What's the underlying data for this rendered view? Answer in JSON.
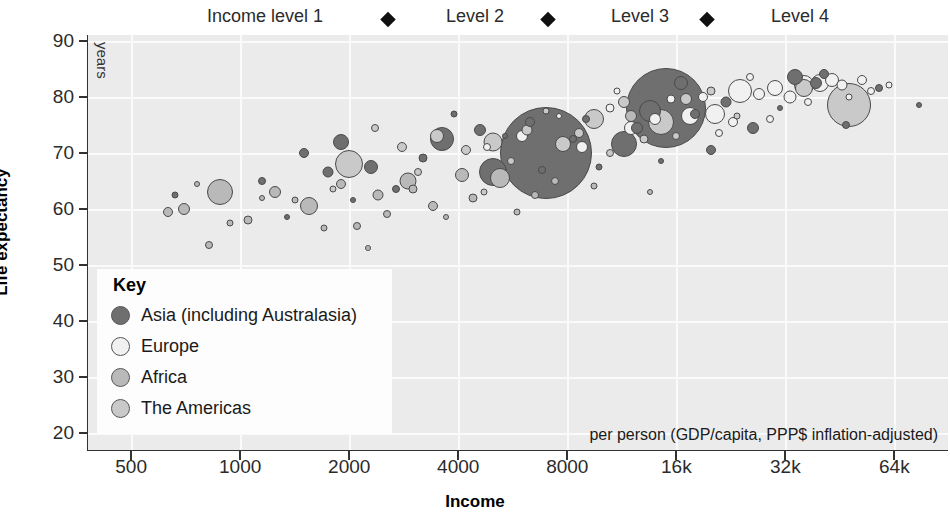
{
  "chart_data": {
    "type": "scatter",
    "title": "",
    "xlabel": "Income",
    "ylabel": "Life expectancy",
    "x_units_note": "per person (GDP/capita, PPP$ inflation-adjusted)",
    "y_units_note": "years",
    "x_scale": "log2",
    "xlim": [
      380,
      90000
    ],
    "ylim": [
      17,
      91
    ],
    "grid": true,
    "legend_position": "inside-bottom-left",
    "xticks": [
      {
        "value": 500,
        "label": "500"
      },
      {
        "value": 1000,
        "label": "1000"
      },
      {
        "value": 2000,
        "label": "2000"
      },
      {
        "value": 4000,
        "label": "4000"
      },
      {
        "value": 8000,
        "label": "8000"
      },
      {
        "value": 16000,
        "label": "16k"
      },
      {
        "value": 32000,
        "label": "32k"
      },
      {
        "value": 64000,
        "label": "64k"
      }
    ],
    "yticks": [
      {
        "value": 20,
        "label": "20"
      },
      {
        "value": 30,
        "label": "30"
      },
      {
        "value": 40,
        "label": "40"
      },
      {
        "value": 50,
        "label": "50"
      },
      {
        "value": 60,
        "label": "60"
      },
      {
        "value": 70,
        "label": "70"
      },
      {
        "value": 80,
        "label": "80"
      },
      {
        "value": 90,
        "label": "90"
      }
    ],
    "income_levels": [
      {
        "label": "Income level 1",
        "center_x": 265
      },
      {
        "label": "Level 2",
        "center_x": 475
      },
      {
        "label": "Level 3",
        "center_x": 640
      },
      {
        "label": "Level 4",
        "center_x": 800
      }
    ],
    "income_level_dividers": [
      388,
      548,
      707
    ],
    "legend": {
      "title": "Key",
      "entries": [
        {
          "name": "Asia (including Australasia)",
          "color": "#6f6f6f"
        },
        {
          "name": "Europe",
          "color": "#f1f1f1"
        },
        {
          "name": "Africa",
          "color": "#b9b9b9"
        },
        {
          "name": "The Americas",
          "color": "#c9c9c9"
        }
      ]
    },
    "series": [
      {
        "name": "Asia (including Australasia)",
        "color": "#6f6f6f",
        "points": [
          {
            "x": 7000,
            "y": 70.0,
            "r": 46.0
          },
          {
            "x": 15000,
            "y": 78.0,
            "r": 40.0
          },
          {
            "x": 5000,
            "y": 66.5,
            "r": 14.0
          },
          {
            "x": 3600,
            "y": 72.5,
            "r": 12.0
          },
          {
            "x": 11500,
            "y": 71.5,
            "r": 13.0
          },
          {
            "x": 13500,
            "y": 77.5,
            "r": 11.0
          },
          {
            "x": 1900,
            "y": 72.0,
            "r": 8.0
          },
          {
            "x": 2300,
            "y": 67.5,
            "r": 7.0
          },
          {
            "x": 4600,
            "y": 74.0,
            "r": 6.0
          },
          {
            "x": 16500,
            "y": 82.5,
            "r": 7.0
          },
          {
            "x": 34000,
            "y": 83.5,
            "r": 8.0
          },
          {
            "x": 39000,
            "y": 82.5,
            "r": 6.0
          },
          {
            "x": 41000,
            "y": 84.0,
            "r": 5.0
          },
          {
            "x": 1500,
            "y": 70.0,
            "r": 5.0
          },
          {
            "x": 1750,
            "y": 66.5,
            "r": 5.5
          },
          {
            "x": 3200,
            "y": 69.0,
            "r": 4.5
          },
          {
            "x": 6300,
            "y": 75.5,
            "r": 5.0
          },
          {
            "x": 9000,
            "y": 76.0,
            "r": 4.0
          },
          {
            "x": 12500,
            "y": 74.5,
            "r": 6.0
          },
          {
            "x": 18000,
            "y": 77.0,
            "r": 5.0
          },
          {
            "x": 22000,
            "y": 79.0,
            "r": 5.5
          },
          {
            "x": 26000,
            "y": 74.5,
            "r": 6.0
          },
          {
            "x": 2700,
            "y": 63.5,
            "r": 4.0
          },
          {
            "x": 6800,
            "y": 67.0,
            "r": 4.0
          },
          {
            "x": 1150,
            "y": 65.0,
            "r": 4.0
          },
          {
            "x": 8300,
            "y": 72.5,
            "r": 4.0
          },
          {
            "x": 20000,
            "y": 70.5,
            "r": 5.0
          },
          {
            "x": 47000,
            "y": 75.0,
            "r": 4.0
          },
          {
            "x": 58000,
            "y": 81.5,
            "r": 4.0
          },
          {
            "x": 75000,
            "y": 78.5,
            "r": 3.0
          },
          {
            "x": 3900,
            "y": 77.0,
            "r": 3.5
          },
          {
            "x": 9800,
            "y": 67.5,
            "r": 3.5
          },
          {
            "x": 2050,
            "y": 61.5,
            "r": 3.0
          },
          {
            "x": 660,
            "y": 62.5,
            "r": 3.5
          },
          {
            "x": 1350,
            "y": 58.5,
            "r": 3.0
          },
          {
            "x": 14500,
            "y": 68.5,
            "r": 3.0
          },
          {
            "x": 31000,
            "y": 78.0,
            "r": 3.0
          },
          {
            "x": 5400,
            "y": 73.0,
            "r": 3.0
          }
        ]
      },
      {
        "name": "Europe",
        "color": "#f1f1f1",
        "points": [
          {
            "x": 24000,
            "y": 81.0,
            "r": 12.0
          },
          {
            "x": 20500,
            "y": 77.0,
            "r": 10.0
          },
          {
            "x": 17500,
            "y": 76.5,
            "r": 9.0
          },
          {
            "x": 36000,
            "y": 82.0,
            "r": 10.0
          },
          {
            "x": 40000,
            "y": 82.5,
            "r": 9.0
          },
          {
            "x": 30000,
            "y": 81.5,
            "r": 8.0
          },
          {
            "x": 43000,
            "y": 83.0,
            "r": 7.0
          },
          {
            "x": 33000,
            "y": 80.0,
            "r": 6.5
          },
          {
            "x": 12000,
            "y": 74.5,
            "r": 7.0
          },
          {
            "x": 8800,
            "y": 71.0,
            "r": 6.0
          },
          {
            "x": 6000,
            "y": 73.0,
            "r": 6.0
          },
          {
            "x": 14000,
            "y": 76.0,
            "r": 6.0
          },
          {
            "x": 27000,
            "y": 80.5,
            "r": 6.0
          },
          {
            "x": 46000,
            "y": 82.0,
            "r": 5.5
          },
          {
            "x": 52000,
            "y": 83.0,
            "r": 5.0
          },
          {
            "x": 19000,
            "y": 80.0,
            "r": 5.0
          },
          {
            "x": 23000,
            "y": 75.5,
            "r": 5.0
          },
          {
            "x": 10500,
            "y": 78.0,
            "r": 4.5
          },
          {
            "x": 15500,
            "y": 79.5,
            "r": 4.5
          },
          {
            "x": 37000,
            "y": 79.0,
            "r": 4.0
          },
          {
            "x": 55000,
            "y": 81.0,
            "r": 4.0
          },
          {
            "x": 29000,
            "y": 76.0,
            "r": 4.0
          },
          {
            "x": 21000,
            "y": 73.5,
            "r": 4.0
          },
          {
            "x": 62000,
            "y": 82.0,
            "r": 3.5
          },
          {
            "x": 4800,
            "y": 71.0,
            "r": 4.0
          },
          {
            "x": 25500,
            "y": 83.5,
            "r": 4.0
          },
          {
            "x": 11000,
            "y": 81.0,
            "r": 3.5
          },
          {
            "x": 48000,
            "y": 80.0,
            "r": 3.5
          },
          {
            "x": 7600,
            "y": 76.5,
            "r": 3.0
          }
        ]
      },
      {
        "name": "Africa",
        "color": "#b9b9b9",
        "points": [
          {
            "x": 880,
            "y": 63.0,
            "r": 13.0
          },
          {
            "x": 1550,
            "y": 60.5,
            "r": 9.0
          },
          {
            "x": 2900,
            "y": 65.0,
            "r": 8.5
          },
          {
            "x": 5200,
            "y": 65.5,
            "r": 10.0
          },
          {
            "x": 4100,
            "y": 66.0,
            "r": 7.0
          },
          {
            "x": 1250,
            "y": 63.0,
            "r": 6.0
          },
          {
            "x": 700,
            "y": 60.0,
            "r": 6.0
          },
          {
            "x": 12000,
            "y": 76.5,
            "r": 6.0
          },
          {
            "x": 2400,
            "y": 62.5,
            "r": 5.5
          },
          {
            "x": 3400,
            "y": 60.5,
            "r": 5.0
          },
          {
            "x": 1900,
            "y": 64.5,
            "r": 5.0
          },
          {
            "x": 630,
            "y": 59.5,
            "r": 5.0
          },
          {
            "x": 820,
            "y": 53.5,
            "r": 4.0
          },
          {
            "x": 1050,
            "y": 58.0,
            "r": 4.5
          },
          {
            "x": 2100,
            "y": 57.0,
            "r": 4.0
          },
          {
            "x": 3000,
            "y": 63.5,
            "r": 4.5
          },
          {
            "x": 4400,
            "y": 62.0,
            "r": 4.5
          },
          {
            "x": 6500,
            "y": 62.5,
            "r": 4.0
          },
          {
            "x": 1700,
            "y": 56.5,
            "r": 3.5
          },
          {
            "x": 2550,
            "y": 59.0,
            "r": 4.0
          },
          {
            "x": 940,
            "y": 57.5,
            "r": 3.5
          },
          {
            "x": 7400,
            "y": 65.0,
            "r": 4.0
          },
          {
            "x": 1420,
            "y": 61.5,
            "r": 3.5
          },
          {
            "x": 5800,
            "y": 59.5,
            "r": 3.5
          },
          {
            "x": 3700,
            "y": 58.5,
            "r": 3.0
          },
          {
            "x": 760,
            "y": 64.5,
            "r": 3.0
          },
          {
            "x": 9500,
            "y": 64.0,
            "r": 3.5
          },
          {
            "x": 2250,
            "y": 53.0,
            "r": 3.0
          },
          {
            "x": 13500,
            "y": 63.0,
            "r": 3.0
          },
          {
            "x": 1150,
            "y": 62.0,
            "r": 3.0
          }
        ]
      },
      {
        "name": "The Americas",
        "color": "#c9c9c9",
        "points": [
          {
            "x": 48000,
            "y": 78.5,
            "r": 22.0
          },
          {
            "x": 2000,
            "y": 68.0,
            "r": 14.0
          },
          {
            "x": 14500,
            "y": 75.5,
            "r": 13.0
          },
          {
            "x": 9500,
            "y": 76.0,
            "r": 10.0
          },
          {
            "x": 5000,
            "y": 72.0,
            "r": 9.5
          },
          {
            "x": 36000,
            "y": 81.5,
            "r": 9.0
          },
          {
            "x": 7800,
            "y": 71.5,
            "r": 8.0
          },
          {
            "x": 3500,
            "y": 73.0,
            "r": 7.0
          },
          {
            "x": 11500,
            "y": 79.0,
            "r": 6.0
          },
          {
            "x": 17000,
            "y": 79.5,
            "r": 6.0
          },
          {
            "x": 6200,
            "y": 74.0,
            "r": 5.5
          },
          {
            "x": 4200,
            "y": 70.5,
            "r": 5.0
          },
          {
            "x": 8600,
            "y": 73.5,
            "r": 5.0
          },
          {
            "x": 2800,
            "y": 71.0,
            "r": 5.0
          },
          {
            "x": 13000,
            "y": 72.5,
            "r": 4.5
          },
          {
            "x": 20000,
            "y": 81.0,
            "r": 4.5
          },
          {
            "x": 3100,
            "y": 66.5,
            "r": 4.0
          },
          {
            "x": 5600,
            "y": 68.5,
            "r": 4.0
          },
          {
            "x": 10500,
            "y": 70.0,
            "r": 4.0
          },
          {
            "x": 2350,
            "y": 74.5,
            "r": 4.0
          },
          {
            "x": 16000,
            "y": 73.0,
            "r": 4.0
          },
          {
            "x": 7000,
            "y": 77.5,
            "r": 3.5
          },
          {
            "x": 23500,
            "y": 76.5,
            "r": 3.5
          },
          {
            "x": 4700,
            "y": 63.0,
            "r": 3.5
          },
          {
            "x": 1800,
            "y": 63.5,
            "r": 3.5
          }
        ]
      }
    ]
  }
}
